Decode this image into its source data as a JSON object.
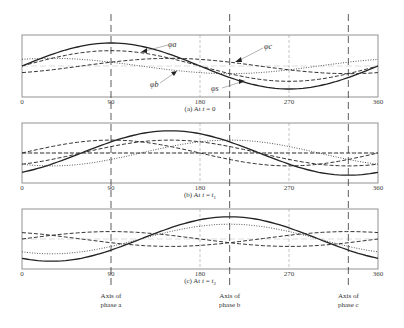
{
  "figure": {
    "x_ticks": [
      "0",
      "90",
      "180",
      "270",
      "360"
    ],
    "panels": [
      {
        "caption": "(a) At t = 0",
        "caption_parts": [
          "(a) At ",
          "t",
          " = 0"
        ],
        "top": 35,
        "bottom": 97
      },
      {
        "caption": "(b) At t = t1",
        "caption_parts": [
          "(b) At ",
          "t",
          " = ",
          "t",
          "1"
        ],
        "top": 123,
        "bottom": 183
      },
      {
        "caption": "(c) At t = t2",
        "caption_parts": [
          "(c) At ",
          "t",
          " = ",
          "t",
          "2"
        ],
        "top": 209,
        "bottom": 269
      }
    ],
    "axes_of_phases": [
      {
        "label_line1": "Axis of",
        "label_line2": "phase a",
        "angle_deg": 90
      },
      {
        "label_line1": "Axis of",
        "label_line2": "phase b",
        "angle_deg": 210
      },
      {
        "label_line1": "Axis of",
        "label_line2": "phase c",
        "angle_deg": 330
      }
    ],
    "flux_labels": {
      "phi_a": "φa",
      "phi_b": "φb",
      "phi_c": "φc",
      "phi_s": "φs"
    }
  },
  "chart_data": {
    "type": "line",
    "xlabel": "Angle (degrees)",
    "x_range": [
      0,
      360
    ],
    "x_ticks": [
      0,
      90,
      180,
      270,
      360
    ],
    "panels": [
      {
        "caption": "(a) At t = 0",
        "series": [
          {
            "name": "phi_s (resultant)",
            "style": "solid",
            "amplitude": 1.5,
            "peak_deg": 90
          },
          {
            "name": "phi_a",
            "style": "dashed",
            "amplitude": 1.0,
            "peak_deg": 90
          },
          {
            "name": "phi_b",
            "style": "dotted",
            "amplitude": 0.5,
            "peak_deg": 30
          },
          {
            "name": "phi_c",
            "style": "dashed",
            "amplitude": 0.5,
            "peak_deg": 150
          }
        ]
      },
      {
        "caption": "(b) At t = t1",
        "series": [
          {
            "name": "phi_s (resultant)",
            "style": "solid",
            "amplitude": 1.5,
            "peak_deg": 150
          },
          {
            "name": "phi_a",
            "style": "dashed",
            "amplitude": 0.87,
            "peak_deg": 90
          },
          {
            "name": "phi_b",
            "style": "dotted",
            "amplitude": 0.87,
            "peak_deg": 210
          },
          {
            "name": "phi_c",
            "style": "dashed",
            "amplitude": 0.0,
            "peak_deg": 330
          },
          {
            "name": "phi_x",
            "style": "dashed",
            "amplitude": 0.87,
            "peak_deg": 150
          }
        ]
      },
      {
        "caption": "(c) At t = t2",
        "series": [
          {
            "name": "phi_s (resultant)",
            "style": "solid",
            "amplitude": 1.5,
            "peak_deg": 210
          },
          {
            "name": "phi_a",
            "style": "dashed",
            "amplitude": 0.5,
            "peak_deg": 90
          },
          {
            "name": "phi_b",
            "style": "dotted",
            "amplitude": 1.0,
            "peak_deg": 210
          },
          {
            "name": "phi_c",
            "style": "dashed",
            "amplitude": 0.5,
            "peak_deg": 330
          }
        ]
      }
    ],
    "annotations": [
      "Axis of phase a",
      "Axis of phase b",
      "Axis of phase c"
    ]
  }
}
